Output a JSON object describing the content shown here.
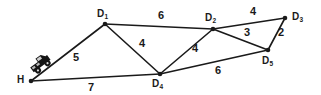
{
  "figure": {
    "type": "weighted-graph-diagram",
    "background_color": "#ffffff",
    "stroke_color": "#1a1a1a",
    "width": 321,
    "height": 95
  },
  "nodes": [
    {
      "id": "H",
      "label": "H",
      "sub": "",
      "x": 31,
      "y": 81,
      "label_x": 17,
      "label_y": 75
    },
    {
      "id": "D1",
      "label": "D",
      "sub": "1",
      "x": 105,
      "y": 24,
      "label_x": 97,
      "label_y": 9
    },
    {
      "id": "D2",
      "label": "D",
      "sub": "2",
      "x": 213,
      "y": 29,
      "label_x": 205,
      "label_y": 13
    },
    {
      "id": "D3",
      "label": "D",
      "sub": "3",
      "x": 285,
      "y": 18,
      "label_x": 292,
      "label_y": 12
    },
    {
      "id": "D4",
      "label": "D",
      "sub": "4",
      "x": 160,
      "y": 74,
      "label_x": 152,
      "label_y": 79
    },
    {
      "id": "D5",
      "label": "D",
      "sub": "5",
      "x": 268,
      "y": 50,
      "label_x": 262,
      "label_y": 56
    }
  ],
  "edges": [
    {
      "from": "H",
      "to": "D1",
      "weight": "5",
      "label_x": 73,
      "label_y": 52
    },
    {
      "from": "H",
      "to": "D4",
      "weight": "7",
      "label_x": 88,
      "label_y": 82
    },
    {
      "from": "D1",
      "to": "D2",
      "weight": "6",
      "label_x": 158,
      "label_y": 10
    },
    {
      "from": "D1",
      "to": "D4",
      "weight": "4",
      "label_x": 139,
      "label_y": 38
    },
    {
      "from": "D2",
      "to": "D3",
      "weight": "4",
      "label_x": 250,
      "label_y": 6
    },
    {
      "from": "D2",
      "to": "D4",
      "weight": "4",
      "label_x": 192,
      "label_y": 43
    },
    {
      "from": "D2",
      "to": "D5",
      "weight": "3",
      "label_x": 244,
      "label_y": 27
    },
    {
      "from": "D3",
      "to": "D5",
      "weight": "2",
      "label_x": 278,
      "label_y": 27
    },
    {
      "from": "D4",
      "to": "D5",
      "weight": "6",
      "label_x": 215,
      "label_y": 65
    }
  ],
  "icons": {
    "truck": {
      "name": "truck-icon",
      "x": 28,
      "y": 54,
      "width": 24,
      "height": 20
    }
  },
  "chart_data": {
    "type": "diagram",
    "title": "",
    "vertices": [
      "H",
      "D1",
      "D2",
      "D3",
      "D4",
      "D5"
    ],
    "edge_list": [
      [
        "H",
        "D1",
        5
      ],
      [
        "H",
        "D4",
        7
      ],
      [
        "D1",
        "D2",
        6
      ],
      [
        "D1",
        "D4",
        4
      ],
      [
        "D2",
        "D3",
        4
      ],
      [
        "D2",
        "D4",
        4
      ],
      [
        "D2",
        "D5",
        3
      ],
      [
        "D3",
        "D5",
        2
      ],
      [
        "D4",
        "D5",
        6
      ]
    ]
  }
}
